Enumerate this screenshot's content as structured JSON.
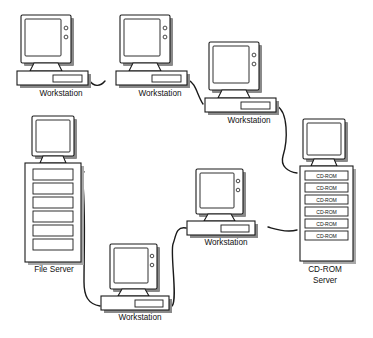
{
  "diagram": {
    "background_color": "#ffffff",
    "line_color": "#1a1a1a",
    "shadow_color": "#8a8a8a",
    "nodes": [
      {
        "id": "ws1",
        "type": "workstation",
        "label": "Workstation",
        "x": 18,
        "y": 14,
        "label_x": 61,
        "label_y": 96
      },
      {
        "id": "ws2",
        "type": "workstation",
        "label": "Workstation",
        "x": 117,
        "y": 14,
        "label_x": 160,
        "label_y": 96
      },
      {
        "id": "ws3",
        "type": "workstation",
        "label": "Workstation",
        "x": 206,
        "y": 41,
        "label_x": 249,
        "label_y": 123
      },
      {
        "id": "fileserver",
        "type": "tower-server",
        "label": "File Server",
        "x": 22,
        "y": 115,
        "label_x": 54,
        "label_y": 268,
        "bays": 6,
        "bay_label": ""
      },
      {
        "id": "ws4",
        "type": "workstation",
        "label": "Workstation",
        "x": 186,
        "y": 168,
        "label_x": 226,
        "label_y": 245
      },
      {
        "id": "ws5",
        "type": "workstation",
        "label": "Workstation",
        "x": 100,
        "y": 242,
        "label_x": 140,
        "label_y": 320
      },
      {
        "id": "cdserver",
        "type": "cdrom-server",
        "label_line1": "CD-ROM",
        "label_line2": "Server",
        "x": 297,
        "y": 118,
        "label_x": 325,
        "label_y": 272
      }
    ],
    "cdrom_bays": [
      {
        "label": "CD-ROM"
      },
      {
        "label": "CD-ROM"
      },
      {
        "label": "CD-ROM"
      },
      {
        "label": "CD-ROM"
      },
      {
        "label": "CD-ROM"
      },
      {
        "label": "CD-ROM"
      }
    ],
    "fileserver_bays": [
      {
        "label": ""
      },
      {
        "label": ""
      },
      {
        "label": ""
      },
      {
        "label": ""
      },
      {
        "label": ""
      },
      {
        "label": ""
      }
    ],
    "connections": [
      {
        "id": "link-ws1-ws2",
        "from": "ws1",
        "to": "ws2"
      },
      {
        "id": "link-ws2-ws3",
        "from": "ws2",
        "to": "ws3"
      },
      {
        "id": "link-ws3-cdserver",
        "from": "ws3",
        "to": "cdserver"
      },
      {
        "id": "link-cdserver-ws4",
        "from": "cdserver",
        "to": "ws4"
      },
      {
        "id": "link-ws4-ws5",
        "from": "ws4",
        "to": "ws5"
      },
      {
        "id": "link-ws5-fileserver",
        "from": "ws5",
        "to": "fileserver"
      }
    ]
  }
}
